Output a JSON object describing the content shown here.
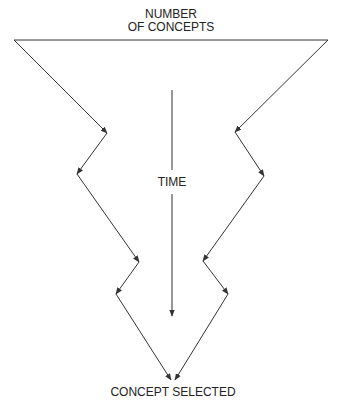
{
  "diagram": {
    "title_line1": "NUMBER",
    "title_line2": "OF CONCEPTS",
    "center_label": "TIME",
    "bottom_label": "CONCEPT SELECTED",
    "colors": {
      "stroke": "#333333",
      "text": "#222222",
      "background": "#ffffff"
    },
    "top_bar": {
      "x1": 14,
      "y1": 40,
      "x2": 328,
      "y2": 40
    },
    "left_path": [
      [
        14,
        40
      ],
      [
        107,
        133
      ],
      [
        77,
        174
      ],
      [
        139,
        262
      ],
      [
        116,
        294
      ],
      [
        171,
        380
      ]
    ],
    "right_path": [
      [
        328,
        40
      ],
      [
        235,
        132
      ],
      [
        264,
        176
      ],
      [
        203,
        261
      ],
      [
        228,
        294
      ],
      [
        175,
        380
      ]
    ],
    "time_arrow": {
      "x": 172,
      "y1": 90,
      "y2": 316
    }
  }
}
